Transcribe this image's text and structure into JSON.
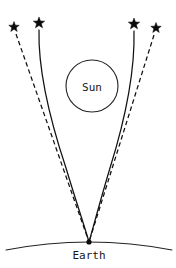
{
  "figure": {
    "type": "diagram",
    "background_color": "#ffffff",
    "line_color": "#111111",
    "width": 176,
    "height": 268
  },
  "labels": {
    "sun": "Sun",
    "earth": "Earth"
  },
  "sun": {
    "label": "Sun",
    "center_x": 92,
    "center_y": 86,
    "radius": 26,
    "label_x": 92,
    "label_y": 88
  },
  "earth": {
    "label": "Earth",
    "observer_x": 89,
    "observer_y": 242,
    "label_x": 89,
    "label_y": 256,
    "arc_path": "M 6 250 Q 89 234 172 250"
  },
  "stars": [
    {
      "name": "star-left-apparent",
      "kind": "apparent",
      "x": 14,
      "y": 27,
      "size": 11,
      "ray_style": "dashed"
    },
    {
      "name": "star-left-true",
      "kind": "true",
      "x": 39,
      "y": 23,
      "size": 12,
      "ray_style": "solid"
    },
    {
      "name": "star-right-true",
      "kind": "true",
      "x": 134,
      "y": 24,
      "size": 12,
      "ray_style": "solid"
    },
    {
      "name": "star-right-apparent",
      "kind": "apparent",
      "x": 156,
      "y": 28,
      "size": 11,
      "ray_style": "dashed"
    }
  ],
  "rays": [
    {
      "name": "ray-left-deflected",
      "style": "solid",
      "path": "M 39 30 C 38 70 50 120 66 168 C 75 198 85 228 89 242"
    },
    {
      "name": "ray-left-straight",
      "style": "dashed",
      "path": "M 16 34 L 89 242"
    },
    {
      "name": "ray-right-deflected",
      "style": "solid",
      "path": "M 134 31 C 135 70 125 120 110 168 C 101 198 93 228 89 242"
    },
    {
      "name": "ray-right-straight",
      "style": "dashed",
      "path": "M 154 35 L 89 242"
    }
  ]
}
